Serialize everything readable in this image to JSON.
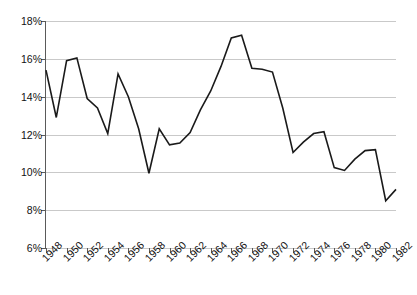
{
  "chart_data": {
    "type": "line",
    "title": "",
    "subtitle": "",
    "xlabel": "",
    "ylabel": "",
    "grid": true,
    "legend": false,
    "legend_position": "none",
    "line_color": "#1a1a1a",
    "grid_color": "#c9c9c9",
    "axis_color": "#5a5a5a",
    "background": "#ffffff",
    "xlim": [
      1948,
      1982
    ],
    "ylim": [
      6,
      18
    ],
    "y_tick_labels": [
      "18%",
      "16%",
      "14%",
      "12%",
      "10%",
      "8%",
      "6%"
    ],
    "y_ticks": [
      18,
      16,
      14,
      12,
      10,
      8,
      6
    ],
    "y_tick_suffix": "%",
    "x_tick_labels": [
      "1948",
      "1950",
      "1952",
      "1954",
      "1956",
      "1958",
      "1960",
      "1962",
      "1964",
      "1966",
      "1968",
      "1970",
      "1972",
      "1974",
      "1976",
      "1978",
      "1980",
      "1982"
    ],
    "x_ticks": [
      1948,
      1950,
      1952,
      1954,
      1956,
      1958,
      1960,
      1962,
      1964,
      1966,
      1968,
      1970,
      1972,
      1974,
      1976,
      1978,
      1980,
      1982
    ],
    "x": [
      1948,
      1949,
      1950,
      1951,
      1952,
      1953,
      1954,
      1955,
      1956,
      1957,
      1958,
      1959,
      1960,
      1961,
      1962,
      1963,
      1964,
      1965,
      1966,
      1967,
      1968,
      1969,
      1970,
      1971,
      1972,
      1973,
      1974,
      1975,
      1976,
      1977,
      1978,
      1979,
      1980,
      1981,
      1982
    ],
    "values": [
      15.4,
      12.9,
      15.9,
      16.05,
      13.9,
      13.4,
      12.05,
      15.2,
      14.0,
      12.3,
      9.95,
      12.3,
      11.45,
      11.55,
      12.1,
      13.3,
      14.3,
      15.6,
      17.1,
      17.25,
      15.5,
      15.45,
      15.3,
      13.4,
      11.05,
      11.6,
      12.05,
      12.15,
      10.25,
      10.1,
      10.7,
      11.15,
      11.2,
      8.5,
      9.1
    ],
    "series": [
      {
        "name": "series-1",
        "values": [
          15.4,
          12.9,
          15.9,
          16.05,
          13.9,
          13.4,
          12.05,
          15.2,
          14.0,
          12.3,
          9.95,
          12.3,
          11.45,
          11.55,
          12.1,
          13.3,
          14.3,
          15.6,
          17.1,
          17.25,
          15.5,
          15.45,
          15.3,
          13.4,
          11.05,
          11.6,
          12.05,
          12.15,
          10.25,
          10.1,
          10.7,
          11.15,
          11.2,
          8.5,
          9.1
        ]
      }
    ],
    "annotations": []
  }
}
